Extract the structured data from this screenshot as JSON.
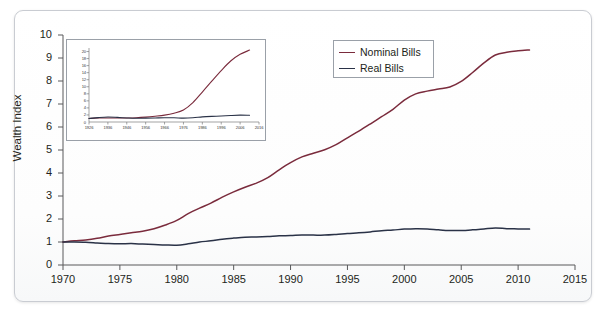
{
  "figure": {
    "background_color": "#ffffff",
    "frame_color": "#c9ccd2"
  },
  "colors": {
    "nominal": "#7a2b3c",
    "real": "#2a3247",
    "axis": "#58595b",
    "text": "#231f20"
  },
  "legend": {
    "position": "top-right-inside",
    "items": [
      {
        "label": "Nominal Bills",
        "color": "#7a2b3c"
      },
      {
        "label": "Real Bills",
        "color": "#2a3247"
      }
    ]
  },
  "chart_data": {
    "type": "line",
    "title": "",
    "xlabel": "",
    "ylabel": "Wealth Index",
    "xlim": [
      1970,
      2015
    ],
    "ylim": [
      0,
      10
    ],
    "grid": false,
    "xticks": [
      1970,
      1975,
      1980,
      1985,
      1990,
      1995,
      2000,
      2005,
      2010,
      2015
    ],
    "yticks": [
      0,
      1,
      2,
      3,
      4,
      5,
      6,
      7,
      8,
      9,
      10
    ],
    "x": [
      1970,
      1971,
      1972,
      1973,
      1974,
      1975,
      1976,
      1977,
      1978,
      1979,
      1980,
      1981,
      1982,
      1983,
      1984,
      1985,
      1986,
      1987,
      1988,
      1989,
      1990,
      1991,
      1992,
      1993,
      1994,
      1995,
      1996,
      1997,
      1998,
      1999,
      2000,
      2001,
      2002,
      2003,
      2004,
      2005,
      2006,
      2007,
      2008,
      2009,
      2010,
      2011
    ],
    "series": [
      {
        "name": "Nominal Bills",
        "color": "#7a2b3c",
        "values": [
          1.0,
          1.05,
          1.09,
          1.16,
          1.26,
          1.33,
          1.4,
          1.47,
          1.58,
          1.74,
          1.94,
          2.23,
          2.47,
          2.69,
          2.95,
          3.18,
          3.38,
          3.56,
          3.8,
          4.14,
          4.45,
          4.7,
          4.86,
          5.01,
          5.23,
          5.53,
          5.82,
          6.13,
          6.45,
          6.77,
          7.17,
          7.44,
          7.56,
          7.65,
          7.74,
          7.98,
          8.37,
          8.79,
          9.13,
          9.25,
          9.31,
          9.35
        ]
      },
      {
        "name": "Real Bills",
        "color": "#2a3247",
        "values": [
          1.0,
          1.0,
          0.99,
          0.96,
          0.93,
          0.92,
          0.93,
          0.91,
          0.89,
          0.87,
          0.86,
          0.92,
          1.0,
          1.05,
          1.12,
          1.17,
          1.21,
          1.22,
          1.24,
          1.27,
          1.28,
          1.3,
          1.3,
          1.3,
          1.33,
          1.37,
          1.4,
          1.44,
          1.49,
          1.52,
          1.56,
          1.58,
          1.57,
          1.53,
          1.5,
          1.5,
          1.53,
          1.57,
          1.61,
          1.58,
          1.57,
          1.56
        ]
      }
    ],
    "inset": {
      "type": "line",
      "xlim": [
        1926,
        2016
      ],
      "ylim": [
        0,
        21
      ],
      "xticks": [
        1926,
        1936,
        1946,
        1956,
        1966,
        1976,
        1986,
        1996,
        2006,
        2016
      ],
      "yticks": [
        0,
        2,
        4,
        6,
        8,
        10,
        12,
        14,
        16,
        18,
        20
      ],
      "x": [
        1926,
        1931,
        1936,
        1941,
        1946,
        1951,
        1956,
        1961,
        1966,
        1971,
        1976,
        1981,
        1986,
        1991,
        1996,
        2001,
        2006,
        2011
      ],
      "series": [
        {
          "name": "Nominal Bills",
          "color": "#7a2b3c",
          "values": [
            1.0,
            1.12,
            1.13,
            1.14,
            1.15,
            1.22,
            1.38,
            1.63,
            1.95,
            2.5,
            3.4,
            5.5,
            8.5,
            11.6,
            14.6,
            17.3,
            19.2,
            20.4
          ]
        },
        {
          "name": "Real Bills",
          "color": "#2a3247",
          "values": [
            1.0,
            1.25,
            1.4,
            1.3,
            1.15,
            1.05,
            1.1,
            1.15,
            1.2,
            1.2,
            1.1,
            1.2,
            1.45,
            1.6,
            1.7,
            1.85,
            1.95,
            1.9
          ]
        }
      ]
    }
  }
}
